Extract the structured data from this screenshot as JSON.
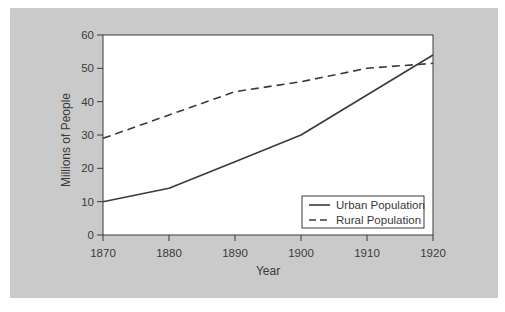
{
  "figure": {
    "background": "#ffffff",
    "panel_color": "#cacaca",
    "plot_bg": "#ffffff",
    "line_color": "#3a3a3a",
    "text_color": "#3a3a3a"
  },
  "chart_data": {
    "type": "line",
    "x": [
      1870,
      1880,
      1890,
      1900,
      1910,
      1920
    ],
    "series": [
      {
        "name": "Urban Population",
        "style": "solid",
        "values": [
          10,
          14,
          22,
          30,
          42,
          54
        ]
      },
      {
        "name": "Rural Population",
        "style": "dashed",
        "values": [
          29,
          36,
          43,
          46,
          50,
          51.5
        ]
      }
    ],
    "title": "",
    "xlabel": "Year",
    "ylabel": "Millions of People",
    "xlim": [
      1870,
      1920
    ],
    "ylim": [
      0,
      60
    ],
    "xticks": [
      1870,
      1880,
      1890,
      1900,
      1910,
      1920
    ],
    "yticks": [
      0,
      10,
      20,
      30,
      40,
      50,
      60
    ],
    "grid": false,
    "legend_position": "lower right"
  }
}
